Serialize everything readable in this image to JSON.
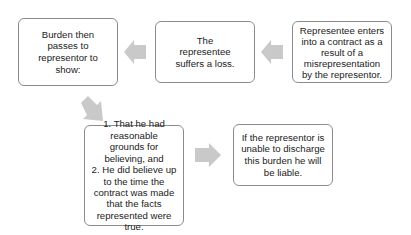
{
  "diagram": {
    "type": "flowchart",
    "arrow_color": "#c9c9c9",
    "border_color": "#8c8c8c",
    "nodes": [
      {
        "id": "n1",
        "text": "Representee enters into a contract as a result of a misrepresentation by the representor."
      },
      {
        "id": "n2",
        "text": "The representee suffers a loss."
      },
      {
        "id": "n3",
        "text": "Burden then passes to representor to show:"
      },
      {
        "id": "n4",
        "text": "1. That he had reasonable grounds for believing, and 2. He did believe up to the time the contract was made that the facts represented were true."
      },
      {
        "id": "n5",
        "text": "If the representor is unable to discharge this burden he will be liable."
      }
    ],
    "edges": [
      {
        "from": "n1",
        "to": "n2",
        "direction": "left"
      },
      {
        "from": "n2",
        "to": "n3",
        "direction": "left"
      },
      {
        "from": "n3",
        "to": "n4",
        "direction": "down-right"
      },
      {
        "from": "n4",
        "to": "n5",
        "direction": "right"
      }
    ]
  },
  "boxes": {
    "representee_enters": "Representee enters into a contract as a result of a misrepresentation by the representor.",
    "suffers_loss": "The representee suffers a loss.",
    "burden_passes": "Burden then passes to representor to show:",
    "conditions_line1": "1. That he had reasonable grounds for believing, and",
    "conditions_line2": "2. He did believe up to the time the contract was made that the facts represented were true.",
    "liable": "If the representor is unable to discharge this burden he will be liable."
  }
}
